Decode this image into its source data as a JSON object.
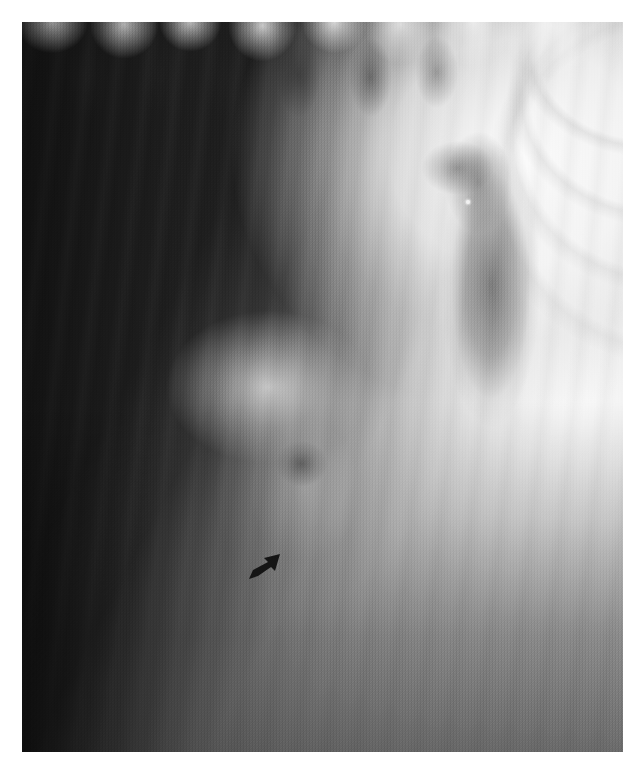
{
  "figure": {
    "kind": "radiograph",
    "modality_label": "Plain radiograph (grayscale film)",
    "caption": "",
    "title": "",
    "orientation": "portrait",
    "plate": {
      "left": 22,
      "top": 22,
      "width": 601,
      "height": 730,
      "background_hex": "#2a2a2a",
      "page_background_hex": "#ffffff"
    }
  },
  "tones": {
    "darkest_hex": "#1a1a1a",
    "dark_field_hex": "#2e2e2e",
    "mid_gray_hex": "#8c8c8c",
    "bright_band_hex": "#d8d8d8",
    "brightest_hex": "#ffffff",
    "marker_hex": "#151515"
  },
  "annotations": [
    {
      "name": "arrow-marker",
      "type": "arrowhead",
      "symbol": "⬈",
      "direction": "up-right",
      "color_hex": "#151515",
      "x": 222,
      "y": 524,
      "width": 40,
      "height": 40,
      "points_at": "focal finding in soft-tissue density"
    }
  ],
  "features": [
    {
      "name": "scalloped-upper-margin",
      "description": "Scalloped wave-like bright arcade along the upper border",
      "region": "top edge, full width",
      "tone": "bright"
    },
    {
      "name": "dark-upper-left-field",
      "description": "Large homogeneous dark (radiolucent) field occupying the upper-left",
      "region": "upper-left quadrant",
      "tone": "dark"
    },
    {
      "name": "diagonal-bright-band",
      "description": "Broad bright diagonal band running from upper-right toward lower-left",
      "region": "centre, diagonal",
      "tone": "bright"
    },
    {
      "name": "vertical-dark-viscus",
      "description": "Elongated vertical dark oval silhouette in the right mid-field",
      "region": "right of centre",
      "tone": "dark-gray"
    },
    {
      "name": "bright-punctate-dot",
      "description": "Small punctate bright focus inside the dark vertical silhouette",
      "region": "right of centre, upper",
      "tone": "brightest"
    },
    {
      "name": "left-soft-tissue-lobe",
      "description": "Rounded bright soft-tissue lobe with a darker nodular shadow beneath it",
      "region": "left of centre, mid-height",
      "tone": "bright"
    },
    {
      "name": "lower-dark-field",
      "description": "Progressive darkening across the lower third of the film",
      "region": "bottom third, full width",
      "tone": "dark"
    },
    {
      "name": "bright-right-margin",
      "description": "Near-white overexposed margin along the right border",
      "region": "right edge",
      "tone": "brightest"
    },
    {
      "name": "film-grain",
      "description": "Visible photographic grain / halftone texture across the whole plate",
      "region": "whole plate",
      "tone": "mixed"
    }
  ],
  "text_elements": []
}
